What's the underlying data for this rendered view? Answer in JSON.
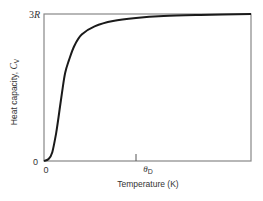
{
  "chart_data": {
    "type": "line",
    "title": "",
    "xlabel": "Temperature (K)",
    "ylabel": "Heat capacity, C_V",
    "ylabel_main": "Heat capacity, ",
    "ylabel_symbol": "C",
    "ylabel_subscript": "V",
    "x_ticks": [
      {
        "label": "0",
        "value": 0
      },
      {
        "label": "θ_D",
        "symbol": "θ",
        "subscript": "D",
        "value": 1
      }
    ],
    "y_ticks": [
      {
        "label": "0",
        "value": 0
      },
      {
        "label": "3R",
        "value": 3
      }
    ],
    "xlim": [
      0,
      2.25
    ],
    "ylim": [
      0,
      3
    ],
    "grid": false,
    "legend": null,
    "series": [
      {
        "name": "Debye heat capacity",
        "color": "#1a1a1a",
        "x": [
          0,
          0.05,
          0.09,
          0.13,
          0.17,
          0.2,
          0.23,
          0.27,
          0.33,
          0.41,
          0.55,
          0.75,
          1.0,
          1.3,
          1.7,
          2.25
        ],
        "y": [
          0,
          0.04,
          0.18,
          0.55,
          1.05,
          1.45,
          1.8,
          2.05,
          2.35,
          2.58,
          2.75,
          2.86,
          2.92,
          2.96,
          2.98,
          3.0
        ]
      }
    ]
  },
  "labels": {
    "x_zero": "0",
    "y_zero": "0",
    "y_top_num": "3",
    "y_top_sym": "R",
    "theta": "θ",
    "theta_sub": "D",
    "xlabel": "Temperature (K)",
    "ylabel_main": "Heat capacity, ",
    "ylabel_sym": "C",
    "ylabel_sub": "V"
  }
}
